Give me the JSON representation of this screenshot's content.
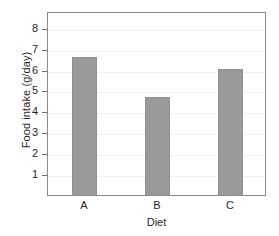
{
  "chart_data": {
    "type": "bar",
    "title": "",
    "categories": [
      "A",
      "B",
      "C"
    ],
    "values": [
      6.7,
      4.8,
      6.1
    ],
    "xlabel": "Diet",
    "ylabel": "Food intake (g/day)",
    "ylim": [
      0,
      8.8
    ],
    "yticks": [
      1,
      2,
      3,
      4,
      5,
      6,
      7,
      8
    ],
    "ytick_labels": [
      "1",
      "2",
      "3",
      "4",
      "5",
      "6",
      "7",
      "8"
    ],
    "grid": true,
    "legend": null,
    "bar_color": "#9a9a9a",
    "frame_color": "#8a8a8a",
    "grid_color": "#f1f1f1"
  }
}
